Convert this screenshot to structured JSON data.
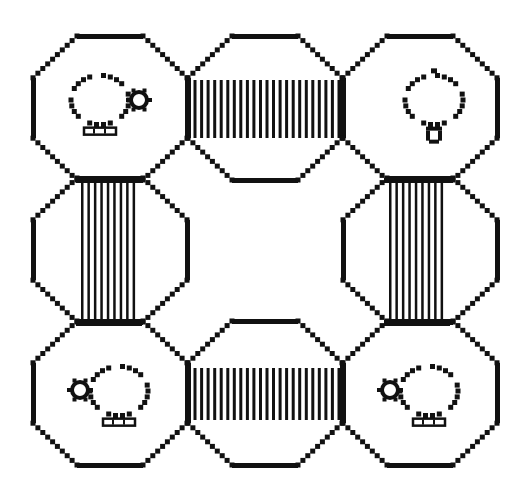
{
  "scene": {
    "width": 517,
    "height": 494,
    "background": "#ffffff",
    "ink": "#111111",
    "grid": {
      "cols": [
        110,
        265,
        420
      ],
      "rows": [
        108,
        250,
        393
      ]
    },
    "room_half_w": 77,
    "room_half_h": 72,
    "room_corner": 44
  },
  "rooms": [
    {
      "id": "top-left",
      "col": 0,
      "row": 0,
      "contents": "pot-right"
    },
    {
      "id": "top-middle",
      "col": 1,
      "row": 0,
      "contents": "empty"
    },
    {
      "id": "top-right",
      "col": 2,
      "row": 0,
      "contents": "pot-down"
    },
    {
      "id": "middle-left",
      "col": 0,
      "row": 1,
      "contents": "empty"
    },
    {
      "id": "middle-right",
      "col": 2,
      "row": 1,
      "contents": "empty"
    },
    {
      "id": "bottom-left",
      "col": 0,
      "row": 2,
      "contents": "pot-left"
    },
    {
      "id": "bottom-middle",
      "col": 1,
      "row": 2,
      "contents": "empty"
    },
    {
      "id": "bottom-right",
      "col": 2,
      "row": 2,
      "contents": "pot-left"
    }
  ],
  "bridges": [
    {
      "id": "bridge-top",
      "orientation": "horizontal",
      "x": 186,
      "y": 80,
      "w": 157,
      "h": 58,
      "lines": 24
    },
    {
      "id": "bridge-bottom",
      "orientation": "horizontal",
      "x": 186,
      "y": 368,
      "w": 157,
      "h": 52,
      "lines": 24
    },
    {
      "id": "bridge-left",
      "orientation": "vertical",
      "x": 80,
      "y": 180,
      "w": 58,
      "h": 142,
      "lines": 9
    },
    {
      "id": "bridge-right",
      "orientation": "vertical",
      "x": 388,
      "y": 180,
      "w": 58,
      "h": 142,
      "lines": 9
    }
  ]
}
